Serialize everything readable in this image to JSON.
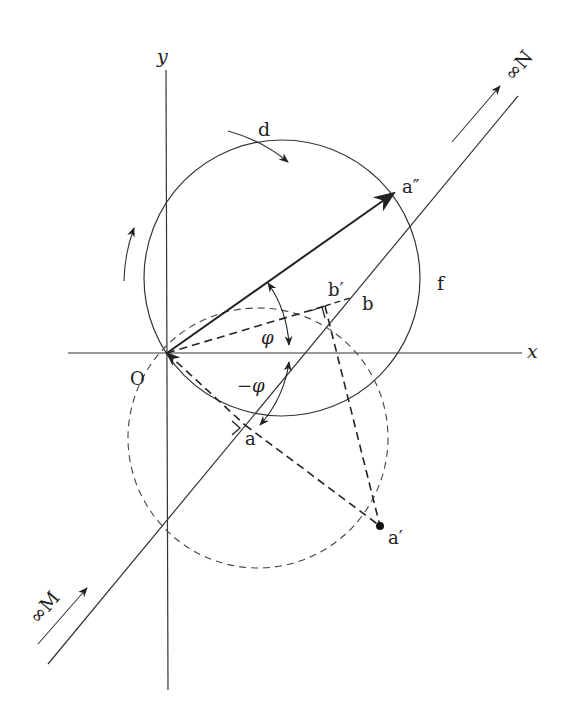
{
  "diagram": {
    "axes": {
      "x_label": "x",
      "y_label": "y",
      "origin_label": "O"
    },
    "points": {
      "a": "a",
      "a_prime": "a′",
      "a_double_prime": "a″",
      "b": "b",
      "b_prime": "b′"
    },
    "arcs": {
      "d": "d",
      "f": "f"
    },
    "angles": {
      "phi": "φ",
      "neg_phi": "−φ"
    },
    "line_ends": {
      "start": "∞M",
      "end": "∞N"
    }
  }
}
